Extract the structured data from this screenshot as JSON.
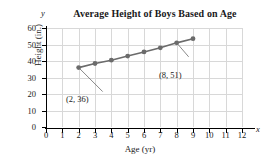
{
  "chart_data": {
    "type": "line",
    "title": "Average Height of Boys Based on Age",
    "xlabel": "Age (yr)",
    "ylabel": "Height (in.)",
    "x_letter": "x",
    "y_letter": "y",
    "xlim": [
      0,
      12
    ],
    "ylim": [
      0,
      60
    ],
    "grid": true,
    "legend": "none",
    "x": [
      2,
      3,
      4,
      5,
      6,
      7,
      8,
      9
    ],
    "values": [
      36,
      38.5,
      40.5,
      43,
      45.5,
      48,
      51,
      53.5
    ],
    "xticks": [
      "0",
      "1",
      "2",
      "3",
      "4",
      "5",
      "6",
      "7",
      "8",
      "9",
      "10",
      "11",
      "12"
    ],
    "yticks": [
      "0",
      "10",
      "20",
      "30",
      "40",
      "50",
      "60"
    ],
    "series_color": "#6b6b6b",
    "grid_color": "#d8d8d8",
    "axis_color": "#000000",
    "annotations": [
      {
        "label": "(2, 36)",
        "x": 2,
        "y": 36
      },
      {
        "label": "(8, 51)",
        "x": 8,
        "y": 51
      }
    ]
  }
}
